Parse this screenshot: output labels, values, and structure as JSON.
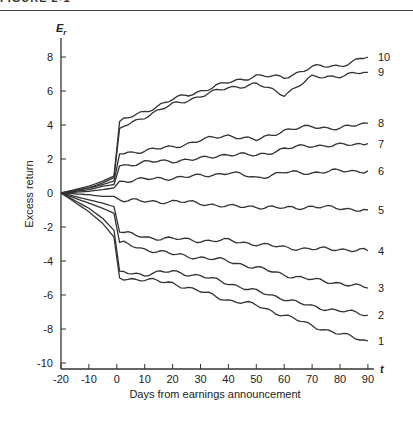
{
  "figure": {
    "caption": "FIGURE 2-1"
  },
  "chart_data": {
    "type": "line",
    "title": "",
    "xlabel": "Days from earnings announcement",
    "ylabel": "Excess return",
    "y_axis_symbol": "Er",
    "x_axis_symbol": "t",
    "xlim": [
      -20,
      90
    ],
    "ylim": [
      -10,
      8
    ],
    "x_ticks": [
      -20,
      -10,
      0,
      10,
      20,
      30,
      40,
      50,
      60,
      70,
      80,
      90
    ],
    "y_ticks": [
      -10,
      -8,
      -6,
      -4,
      -2,
      0,
      2,
      4,
      6,
      8
    ],
    "grid": false,
    "legend": "inline labels at right end of each line",
    "x": [
      -20,
      -10,
      -5,
      -1,
      1,
      10,
      20,
      30,
      40,
      50,
      60,
      70,
      80,
      90
    ],
    "series": [
      {
        "name": "10",
        "values": [
          0,
          0.4,
          0.7,
          1.0,
          4.2,
          4.8,
          5.5,
          6.0,
          6.5,
          6.9,
          6.8,
          7.4,
          7.5,
          8.0
        ]
      },
      {
        "name": "9",
        "values": [
          0,
          0.3,
          0.6,
          0.9,
          3.8,
          4.5,
          5.2,
          5.7,
          6.2,
          6.4,
          5.8,
          6.8,
          6.9,
          7.1
        ]
      },
      {
        "name": "8",
        "values": [
          0,
          0.3,
          0.5,
          0.7,
          2.3,
          2.5,
          2.7,
          3.1,
          3.4,
          3.1,
          3.7,
          3.9,
          3.8,
          4.1
        ]
      },
      {
        "name": "7",
        "values": [
          0,
          0.2,
          0.4,
          0.5,
          1.6,
          1.8,
          1.9,
          2.0,
          2.3,
          2.2,
          2.6,
          2.8,
          2.8,
          2.9
        ]
      },
      {
        "name": "6",
        "values": [
          0,
          0.1,
          0.2,
          0.3,
          0.7,
          0.8,
          0.9,
          1.0,
          1.2,
          0.9,
          1.2,
          1.2,
          1.3,
          1.3
        ]
      },
      {
        "name": "5",
        "values": [
          0,
          -0.1,
          -0.2,
          -0.2,
          -0.4,
          -0.5,
          -0.5,
          -0.6,
          -0.8,
          -0.8,
          -0.9,
          -0.8,
          -0.9,
          -1.0
        ]
      },
      {
        "name": "4",
        "values": [
          0,
          -0.4,
          -0.6,
          -0.8,
          -2.3,
          -2.6,
          -2.7,
          -2.8,
          -2.8,
          -3.0,
          -3.2,
          -3.3,
          -3.3,
          -3.4
        ]
      },
      {
        "name": "3",
        "values": [
          0,
          -0.6,
          -0.9,
          -1.2,
          -2.9,
          -3.3,
          -3.6,
          -3.8,
          -4.0,
          -4.4,
          -4.8,
          -5.1,
          -5.3,
          -5.6
        ]
      },
      {
        "name": "2",
        "values": [
          0,
          -0.9,
          -1.5,
          -2.2,
          -4.6,
          -4.8,
          -4.6,
          -4.9,
          -5.3,
          -5.8,
          -6.2,
          -6.7,
          -6.9,
          -7.2
        ]
      },
      {
        "name": "1",
        "values": [
          0,
          -1.1,
          -1.8,
          -2.6,
          -5.0,
          -5.1,
          -5.3,
          -5.8,
          -6.3,
          -6.6,
          -7.2,
          -7.8,
          -8.3,
          -8.7
        ]
      }
    ]
  }
}
